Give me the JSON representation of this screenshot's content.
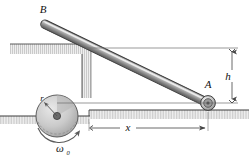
{
  "figure": {
    "type": "mechanics-diagram",
    "width": 249,
    "height": 162,
    "background_color": "#ffffff"
  },
  "labels": {
    "point_b": "B",
    "point_a": "A",
    "height": "h",
    "distance": "x",
    "radius": "r",
    "omega": "ω",
    "omega_subscript": "0"
  },
  "colors": {
    "rod_fill": "#8c8c8c",
    "rod_highlight": "#d5d5d5",
    "rod_outline": "#3a3a3a",
    "hatch_light": "#ececec",
    "hatch_dark": "#9a9a9a",
    "ground_line": "#444444",
    "dimension_line": "#555555",
    "disk_fill": "#c9c9c9",
    "disk_outline": "#5a5a5a",
    "label_color": "#111111"
  },
  "geometry": {
    "rod_end_b": {
      "x": 42,
      "y": 23
    },
    "rod_end_a": {
      "x": 208,
      "y": 103
    },
    "roller_a_radius": 7,
    "disk_center": {
      "x": 57,
      "y": 116
    },
    "disk_radius": 21,
    "hub_radius": 3.5,
    "ground_right_y": 110,
    "ground_left_y": 116,
    "dimension_h_top_y": 48,
    "dimension_h_bottom_y": 103,
    "dimension_h_x": 232,
    "dimension_x_y": 128,
    "dimension_x_left": 89,
    "dimension_x_right": 208,
    "wall_top_beam": {
      "x": 10,
      "y": 44,
      "width": 82,
      "height": 10
    },
    "wall_column": {
      "x": 82,
      "y": 44,
      "width": 9,
      "height": 54
    }
  },
  "annotations": {
    "h_description": "Vertical height dimension from ground to rod top reference line",
    "x_description": "Horizontal distance dimension from step edge to roller A",
    "omega_description": "Angular velocity of driving disk, counterclockwise curved arrow",
    "r_description": "Radius arrow of the driving disk"
  }
}
